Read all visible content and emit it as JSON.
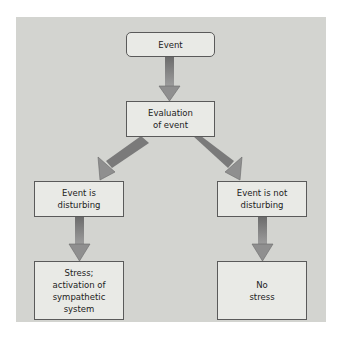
{
  "diagram": {
    "nodes": [
      {
        "id": "event",
        "label": "Event"
      },
      {
        "id": "evaluation",
        "label": "Evaluation\nof event"
      },
      {
        "id": "disturbing",
        "label": "Event is\ndisturbing"
      },
      {
        "id": "not_disturbing",
        "label": "Event is not\ndisturbing"
      },
      {
        "id": "stress",
        "label": "Stress;\nactivation of\nsympathetic\nsystem"
      },
      {
        "id": "no_stress",
        "label": "No\nstress"
      }
    ],
    "edges": [
      {
        "from": "event",
        "to": "evaluation"
      },
      {
        "from": "evaluation",
        "to": "disturbing"
      },
      {
        "from": "evaluation",
        "to": "not_disturbing"
      },
      {
        "from": "disturbing",
        "to": "stress"
      },
      {
        "from": "not_disturbing",
        "to": "no_stress"
      }
    ],
    "colors": {
      "background": "#d3d4d0",
      "box_fill": "#e9eae6",
      "box_border": "#5a5a5a",
      "arrow_dark": "#5f5f5f",
      "arrow_light": "#a8a8a8"
    }
  }
}
